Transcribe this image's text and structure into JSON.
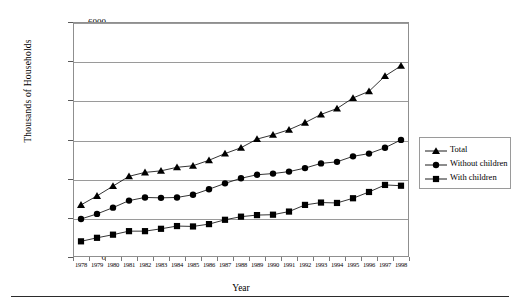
{
  "chart_data": {
    "type": "line",
    "title": "",
    "xlabel": "Year",
    "ylabel": "Thousands of Households",
    "categories": [
      1978,
      1979,
      1980,
      1981,
      1982,
      1983,
      1984,
      1985,
      1986,
      1987,
      1988,
      1989,
      1990,
      1991,
      1992,
      1993,
      1994,
      1995,
      1996,
      1997,
      1998
    ],
    "xtick_labels": [
      "1978",
      "1979",
      "1980",
      "1981",
      "1982",
      "1983",
      "1984",
      "1985",
      "1986",
      "1987",
      "1988",
      "1989",
      "1990",
      "1991",
      "1992",
      "1993",
      "1994",
      "1995",
      "1996",
      "1997",
      "1998"
    ],
    "ytick_labels": [
      "0",
      "1000",
      "2000",
      "3000",
      "4000",
      "5000",
      "6000"
    ],
    "ylim": [
      0,
      6000
    ],
    "ytick_step": 1000,
    "grid": true,
    "legend_position": "right",
    "series": [
      {
        "name": "Total",
        "marker": "triangle",
        "color": "#000000",
        "values": [
          1330,
          1560,
          1810,
          2060,
          2160,
          2200,
          2290,
          2330,
          2470,
          2640,
          2790,
          3010,
          3120,
          3250,
          3430,
          3640,
          3790,
          4060,
          4230,
          4620,
          4880
        ]
      },
      {
        "name": "Without children",
        "marker": "circle",
        "color": "#000000",
        "values": [
          970,
          1100,
          1260,
          1440,
          1520,
          1510,
          1520,
          1590,
          1730,
          1880,
          2010,
          2100,
          2130,
          2180,
          2270,
          2390,
          2430,
          2570,
          2640,
          2790,
          2990
        ]
      },
      {
        "name": "With children",
        "marker": "square",
        "color": "#000000",
        "values": [
          400,
          490,
          570,
          660,
          660,
          720,
          790,
          780,
          840,
          950,
          1030,
          1070,
          1080,
          1160,
          1330,
          1390,
          1380,
          1500,
          1660,
          1840,
          1820
        ]
      }
    ]
  },
  "legend": {
    "items": [
      {
        "label": "Total"
      },
      {
        "label": "Without children"
      },
      {
        "label": "With children"
      }
    ]
  }
}
